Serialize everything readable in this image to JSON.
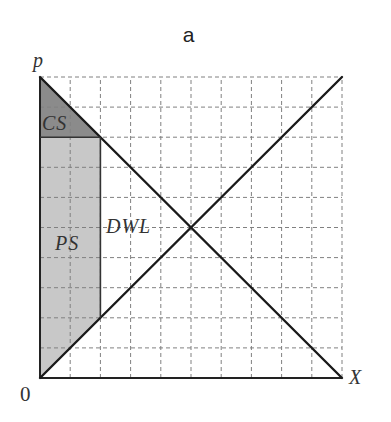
{
  "figure": {
    "title": "a"
  },
  "colors": {
    "background": "#ffffff",
    "grid": "#808080",
    "curve": "#1a1a1a",
    "axis": "#222222",
    "segment": "#333333",
    "cs_fill": "#8b8b8b",
    "ps_fill": "#c8c8c8"
  },
  "chart_data": {
    "type": "line",
    "title": "a",
    "xlabel": "X",
    "ylabel": "p",
    "origin_label": "0",
    "xlim": [
      0,
      10
    ],
    "ylim": [
      0,
      10
    ],
    "grid": true,
    "grid_step": 1,
    "grid_style": "dashed",
    "tick_labels": "none",
    "legend": null,
    "series": [
      {
        "name": "Demand",
        "points": [
          [
            0,
            10
          ],
          [
            10,
            0
          ]
        ]
      },
      {
        "name": "Supply",
        "points": [
          [
            0,
            0
          ],
          [
            10,
            10
          ]
        ]
      }
    ],
    "equilibrium": [
      5,
      5
    ],
    "quantity_restriction": {
      "x": 2,
      "demand_price": 8,
      "supply_price": 2
    },
    "regions": [
      {
        "name": "CS",
        "label": "CS",
        "points": [
          [
            0,
            10
          ],
          [
            0,
            8
          ],
          [
            2,
            8
          ]
        ],
        "fill": "#8b8b8b"
      },
      {
        "name": "PS",
        "label": "PS",
        "points": [
          [
            0,
            8
          ],
          [
            2,
            8
          ],
          [
            2,
            2
          ],
          [
            0,
            0
          ]
        ],
        "fill": "#c8c8c8"
      },
      {
        "name": "DWL",
        "label": "DWL",
        "points": [
          [
            2,
            8
          ],
          [
            5,
            5
          ],
          [
            2,
            2
          ]
        ],
        "fill": null
      }
    ],
    "segments": [
      {
        "name": "restricted-price-line",
        "from": [
          0,
          8
        ],
        "to": [
          2,
          8
        ]
      },
      {
        "name": "restricted-quantity-line",
        "from": [
          2,
          8
        ],
        "to": [
          2,
          2
        ]
      }
    ]
  }
}
